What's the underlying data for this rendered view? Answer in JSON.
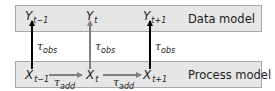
{
  "diagram": {
    "layers": [
      {
        "id": "data",
        "label": "Data model"
      },
      {
        "id": "process",
        "label": "Process model"
      }
    ],
    "observations": [
      {
        "symbol": "Y",
        "subscript": "t−1"
      },
      {
        "symbol": "Y",
        "subscript": "t"
      },
      {
        "symbol": "Y",
        "subscript": "t+1"
      }
    ],
    "states": [
      {
        "symbol": "X",
        "subscript": "t−1"
      },
      {
        "symbol": "X",
        "subscript": "t"
      },
      {
        "symbol": "X",
        "subscript": "t+1"
      }
    ],
    "observation_edges": [
      {
        "from": "X t−1",
        "to": "Y t−1",
        "tau": "τ",
        "tau_sub": "obs",
        "color": "#000000"
      },
      {
        "from": "X t",
        "to": "Y t",
        "tau": "τ",
        "tau_sub": "obs",
        "color": "#808080"
      },
      {
        "from": "X t+1",
        "to": "Y t+1",
        "tau": "τ",
        "tau_sub": "obs",
        "color": "#000000"
      }
    ],
    "transition_edges": [
      {
        "from": "X t−1",
        "to": "X t",
        "tau": "τ",
        "tau_sub": "add",
        "color": "#808080"
      },
      {
        "from": "X t",
        "to": "X t+1",
        "tau": "τ",
        "tau_sub": "add",
        "color": "#808080"
      }
    ],
    "colors": {
      "band_fill": "#e6e6e6",
      "band_border": "#a8a8a8",
      "arrow_dark": "#000000",
      "arrow_gray": "#808080",
      "text": "#1e1e1e"
    }
  }
}
